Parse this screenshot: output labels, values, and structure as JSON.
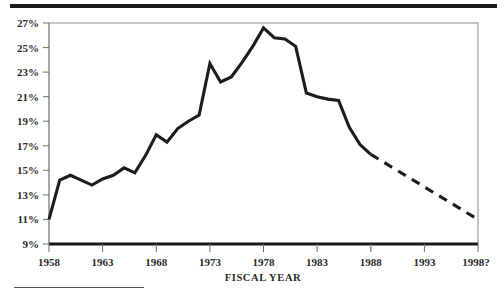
{
  "chart_data": {
    "type": "line",
    "title": "",
    "subtitle": "",
    "xlabel": "FISCAL YEAR",
    "ylabel": "",
    "xlim": [
      1958,
      1998
    ],
    "ylim": [
      9,
      27
    ],
    "grid": false,
    "legend": null,
    "y_tick_labels": [
      "27%",
      "25%",
      "23%",
      "21%",
      "19%",
      "17%",
      "15%",
      "13%",
      "11%",
      "9%"
    ],
    "y_tick_values": [
      27,
      25,
      23,
      21,
      19,
      17,
      15,
      13,
      11,
      9
    ],
    "x_tick_labels": [
      "1958",
      "1963",
      "1968",
      "1973",
      "1978",
      "1983",
      "1988",
      "1993",
      "1998?"
    ],
    "x_tick_values": [
      1958,
      1963,
      1968,
      1973,
      1978,
      1983,
      1988,
      1993,
      1998
    ],
    "series": [
      {
        "name": "actual",
        "style": "solid",
        "x": [
          1958,
          1959,
          1960,
          1961,
          1962,
          1963,
          1964,
          1965,
          1966,
          1967,
          1968,
          1969,
          1970,
          1971,
          1972,
          1973,
          1974,
          1975,
          1976,
          1977,
          1978,
          1979,
          1980,
          1981,
          1982,
          1983,
          1984,
          1985,
          1986,
          1987,
          1988
        ],
        "y": [
          11.0,
          14.2,
          14.6,
          14.2,
          13.8,
          14.3,
          14.6,
          15.2,
          14.8,
          16.2,
          17.9,
          17.3,
          18.4,
          19.0,
          19.5,
          23.7,
          22.2,
          22.6,
          23.8,
          25.1,
          26.6,
          25.8,
          25.7,
          25.1,
          21.3,
          21.0,
          20.8,
          20.7,
          18.5,
          17.1,
          16.3
        ]
      },
      {
        "name": "projected",
        "style": "dashed",
        "x": [
          1988,
          1998
        ],
        "y": [
          16.3,
          11.0
        ]
      }
    ],
    "annotations": [
      {
        "text": "1998?",
        "note": "terminal x-axis tick carries a question mark indicating projection"
      }
    ]
  },
  "figure": {
    "top_rule_name": "top-divider-rule",
    "bottom_rule_name": "bottom-divider-rule",
    "axis_title": "FISCAL YEAR"
  },
  "colors": {
    "line": "#1c1c1c",
    "axis": "#8c8c8c",
    "baseline": "#1a1a1a",
    "text": "#2b2b2b",
    "background": "#ffffff"
  }
}
